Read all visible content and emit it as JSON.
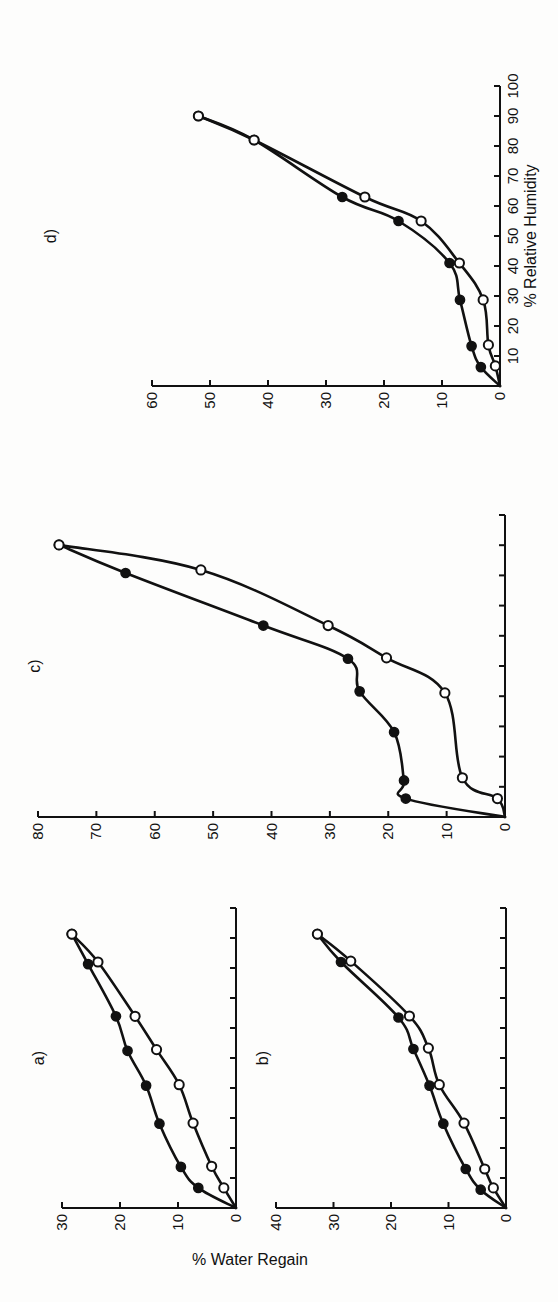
{
  "figure": {
    "ylabel": "% Water Regain",
    "xlabel": "% Relative Humidity"
  },
  "chart_data": [
    {
      "type": "scatter",
      "panel": "a)",
      "title": "a)",
      "xlabel": "% Relative Humidity",
      "ylabel": "% Water Regain",
      "xlim": [
        0,
        100
      ],
      "ylim": [
        0,
        30
      ],
      "xticks": [
        0,
        10,
        20,
        30,
        40,
        50,
        60,
        70,
        80,
        90,
        100
      ],
      "xtick_labels": [],
      "yticks": [
        0,
        10,
        20,
        30
      ],
      "ytick_labels": [
        "0",
        "10",
        "20",
        "30"
      ],
      "series": [
        {
          "name": "filled",
          "marker": "filled-circle",
          "x": [
            0,
            6.7,
            13.7,
            28.1,
            40.8,
            52.4,
            63.9,
            81.3,
            91.3
          ],
          "y": [
            0,
            6.5,
            9.5,
            13.2,
            15.5,
            18.7,
            20.7,
            25.5,
            28.3
          ]
        },
        {
          "name": "open",
          "marker": "open-circle",
          "x": [
            0,
            6.7,
            13.9,
            28.3,
            41.1,
            52.8,
            63.9,
            82.0,
            91.3
          ],
          "y": [
            0,
            2.1,
            4.2,
            7.4,
            9.8,
            13.7,
            17.4,
            23.8,
            28.3
          ]
        }
      ]
    },
    {
      "type": "scatter",
      "panel": "b)",
      "title": "b)",
      "xlabel": "% Relative Humidity",
      "ylabel": "% Water Regain",
      "xlim": [
        0,
        100
      ],
      "ylim": [
        0,
        40
      ],
      "xticks": [
        0,
        10,
        20,
        30,
        40,
        50,
        60,
        70,
        80,
        90,
        100
      ],
      "xtick_labels": [],
      "yticks": [
        0,
        10,
        20,
        30,
        40
      ],
      "ytick_labels": [
        "0",
        "10",
        "20",
        "30",
        "40"
      ],
      "series": [
        {
          "name": "filled",
          "marker": "filled-circle",
          "x": [
            0,
            6.1,
            13.0,
            28.1,
            40.8,
            53.0,
            63.5,
            82.0,
            91.3
          ],
          "y": [
            0,
            4.4,
            7.0,
            10.9,
            13.3,
            16.1,
            18.7,
            28.7,
            32.8
          ]
        },
        {
          "name": "open",
          "marker": "open-circle",
          "x": [
            0,
            6.7,
            13.0,
            28.3,
            41.1,
            53.3,
            64.0,
            82.3,
            91.3
          ],
          "y": [
            0,
            2.2,
            3.7,
            7.3,
            11.6,
            13.5,
            16.8,
            27.0,
            32.8
          ]
        }
      ]
    },
    {
      "type": "scatter",
      "panel": "c)",
      "title": "c)",
      "xlabel": "% Relative Humidity",
      "ylabel": "% Water Regain",
      "xlim": [
        0,
        100
      ],
      "ylim": [
        0,
        80
      ],
      "xticks": [
        0,
        10,
        20,
        30,
        40,
        50,
        60,
        70,
        80,
        90,
        100
      ],
      "xtick_labels": [],
      "yticks": [
        0,
        10,
        20,
        30,
        40,
        50,
        60,
        70,
        80
      ],
      "ytick_labels": [
        "0",
        "10",
        "20",
        "30",
        "40",
        "50",
        "60",
        "70",
        "80"
      ],
      "series": [
        {
          "name": "filled",
          "marker": "filled-circle",
          "x": [
            0,
            6.1,
            12.1,
            28.1,
            41.6,
            52.4,
            63.4,
            80.8,
            90.1
          ],
          "y": [
            0,
            17.0,
            17.3,
            19.0,
            24.9,
            26.9,
            41.4,
            65.0,
            76.4
          ]
        },
        {
          "name": "open",
          "marker": "open-circle",
          "x": [
            0,
            6.1,
            13.0,
            41.1,
            52.7,
            63.4,
            81.8,
            90.1
          ],
          "y": [
            0,
            1.3,
            7.3,
            10.3,
            20.3,
            30.3,
            52.1,
            76.4
          ]
        }
      ]
    },
    {
      "type": "scatter",
      "panel": "d)",
      "title": "d)",
      "xlabel": "% Relative Humidity",
      "ylabel": "% Water Regain",
      "xlim": [
        0,
        100
      ],
      "ylim": [
        0,
        60
      ],
      "xticks": [
        0,
        10,
        20,
        30,
        40,
        50,
        60,
        70,
        80,
        90,
        100
      ],
      "xtick_labels": [
        "10",
        "20",
        "30",
        "40",
        "50",
        "60",
        "70",
        "80",
        "90",
        "100"
      ],
      "yticks": [
        0,
        10,
        20,
        30,
        40,
        50,
        60
      ],
      "ytick_labels": [
        "0",
        "10",
        "20",
        "30",
        "40",
        "50",
        "60"
      ],
      "series": [
        {
          "name": "filled",
          "marker": "filled-circle",
          "x": [
            0,
            6.3,
            13.3,
            28.7,
            41.0,
            55.0,
            63.0,
            82.0,
            90.0
          ],
          "y": [
            0,
            3.3,
            4.9,
            6.9,
            8.7,
            17.5,
            27.2,
            42.4,
            52.0
          ]
        },
        {
          "name": "open",
          "marker": "open-circle",
          "x": [
            0,
            6.7,
            13.7,
            28.7,
            41.0,
            55.0,
            63.0,
            82.0,
            90.0
          ],
          "y": [
            0,
            0.8,
            2.0,
            2.9,
            7.0,
            13.6,
            23.3,
            42.4,
            52.0
          ]
        }
      ]
    }
  ]
}
